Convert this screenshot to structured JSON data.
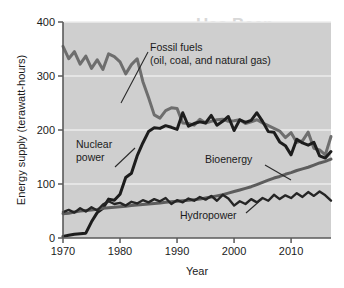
{
  "figure": {
    "page_background": "#ffffff",
    "plot_background": "#cfcfcf",
    "gridline_color": "#ececec",
    "axis_color": "#5a5a5a",
    "ghost_text_top": "Has Been",
    "ghost_text_mid": "ion Progression"
  },
  "chart_data": {
    "type": "line",
    "title": "",
    "xlabel": "Year",
    "ylabel": "Energy supply (terawatt-hours)",
    "xlim": [
      1970,
      2017
    ],
    "ylim": [
      0,
      400
    ],
    "xticks": [
      1970,
      1980,
      1990,
      2000,
      2010
    ],
    "yticks": [
      0,
      100,
      200,
      300,
      400
    ],
    "grid": "horizontal-white",
    "legend": "none-inline-annotations",
    "x": [
      1970,
      1971,
      1972,
      1973,
      1974,
      1975,
      1976,
      1977,
      1978,
      1979,
      1980,
      1981,
      1982,
      1983,
      1984,
      1985,
      1986,
      1987,
      1988,
      1989,
      1990,
      1991,
      1992,
      1993,
      1994,
      1995,
      1996,
      1997,
      1998,
      1999,
      2000,
      2001,
      2002,
      2003,
      2004,
      2005,
      2006,
      2007,
      2008,
      2009,
      2010,
      2011,
      2012,
      2013,
      2014,
      2015,
      2016,
      2017
    ],
    "series": [
      {
        "name": "Fossil fuels",
        "label": "Fossil fuels",
        "sublabel": "(oil, coal, and natural gas)",
        "color": "#6e6e6e",
        "width": 3.0,
        "values": [
          355,
          332,
          345,
          322,
          337,
          314,
          330,
          312,
          341,
          336,
          326,
          304,
          321,
          332,
          290,
          260,
          228,
          222,
          236,
          241,
          240,
          213,
          212,
          209,
          220,
          213,
          216,
          219,
          220,
          216,
          217,
          219,
          212,
          215,
          219,
          213,
          208,
          203,
          198,
          186,
          195,
          177,
          180,
          196,
          166,
          163,
          154,
          188
        ]
      },
      {
        "name": "Nuclear power",
        "label": "Nuclear",
        "sublabel": "power",
        "color": "#1d1d1d",
        "width": 3.0,
        "values": [
          3,
          5,
          7,
          8,
          9,
          30,
          47,
          55,
          72,
          70,
          81,
          112,
          120,
          152,
          176,
          197,
          204,
          203,
          208,
          205,
          201,
          232,
          207,
          212,
          215,
          213,
          227,
          209,
          216,
          225,
          199,
          219,
          214,
          218,
          232,
          216,
          197,
          196,
          178,
          171,
          154,
          183,
          176,
          172,
          177,
          152,
          148,
          160
        ]
      },
      {
        "name": "Bioenergy",
        "label": "Bioenergy",
        "sublabel": "",
        "color": "#5d5d5d",
        "width": 3.0,
        "values": [
          45,
          46,
          48,
          50,
          51,
          52,
          53,
          55,
          56,
          57,
          58,
          59,
          60,
          61,
          62,
          63,
          64,
          65,
          66,
          67,
          68,
          69,
          70,
          71,
          72,
          74,
          76,
          78,
          80,
          83,
          86,
          89,
          92,
          95,
          99,
          103,
          107,
          111,
          114,
          118,
          121,
          125,
          128,
          131,
          135,
          139,
          142,
          146
        ]
      },
      {
        "name": "Hydropower",
        "label": "Hydropower",
        "sublabel": "",
        "color": "#252525",
        "width": 2.4,
        "values": [
          48,
          52,
          47,
          55,
          49,
          57,
          51,
          62,
          68,
          63,
          65,
          60,
          67,
          64,
          70,
          66,
          72,
          68,
          74,
          63,
          70,
          66,
          73,
          69,
          76,
          71,
          78,
          69,
          80,
          73,
          60,
          68,
          63,
          72,
          66,
          74,
          69,
          80,
          72,
          79,
          74,
          83,
          76,
          85,
          78,
          86,
          79,
          69
        ]
      }
    ],
    "annotations": [
      {
        "name": "fossil-fuels-annotation",
        "text_line1": "Fossil fuels",
        "text_line2": "(oil, coal, and natural gas)"
      },
      {
        "name": "nuclear-power-annotation",
        "text_line1": "Nuclear",
        "text_line2": "power"
      },
      {
        "name": "bioenergy-annotation",
        "text_line1": "Bioenergy",
        "text_line2": ""
      },
      {
        "name": "hydropower-annotation",
        "text_line1": "Hydropower",
        "text_line2": ""
      }
    ]
  }
}
